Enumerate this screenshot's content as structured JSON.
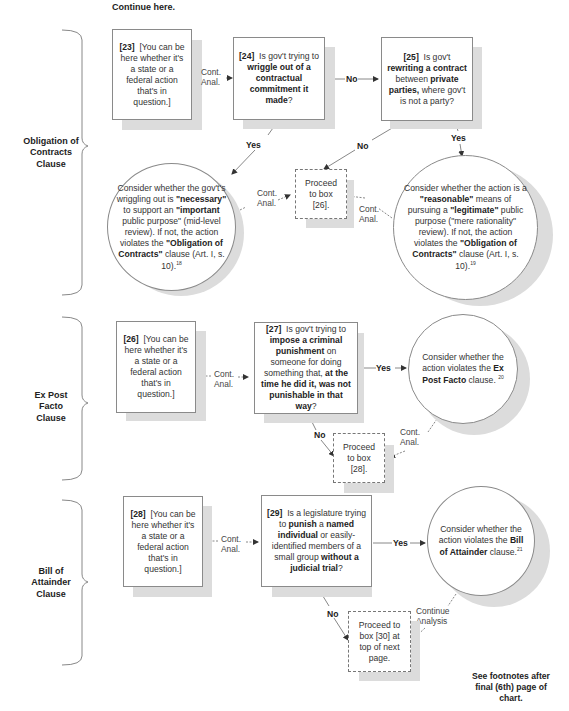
{
  "header": {
    "continue_text": "Continue here."
  },
  "sections": [
    {
      "label_lines": [
        "Obligation of",
        "Contracts",
        "Clause"
      ]
    },
    {
      "label_lines": [
        "Ex Post",
        "Facto",
        "Clause"
      ]
    },
    {
      "label_lines": [
        "Bill of",
        "Attainder",
        "Clause"
      ]
    }
  ],
  "edge_labels": {
    "cont": "Cont.",
    "anal": "Anal.",
    "yes": "Yes",
    "no": "No",
    "continue": "Continue",
    "analysis": "Analysis"
  },
  "boxes": {
    "b23": {
      "num": "[23]",
      "text": "[You can be here whether it's a state or a federal action that's in question.]"
    },
    "b24": {
      "num": "[24]",
      "pre": "Is gov't trying to ",
      "bold1": "wriggle out of a contractual commitment it made",
      "post": "?"
    },
    "b25": {
      "num": "[25]",
      "pre": "Is gov't ",
      "bold1": "rewriting a contract",
      "mid": " between ",
      "bold2": "private parties,",
      "post": " where gov't is not a party?"
    },
    "p26": {
      "text": "Proceed to box [26]."
    },
    "c_mid": {
      "t1": "Consider whether the gov't's wriggling out is ",
      "b1": "\"necessary\"",
      "t2": " to support an ",
      "b2": "\"important",
      "t3": " public purpose\" (mid-level review). If not, the action violates the ",
      "b3": "\"Obligation of Contracts\"",
      "t4": " clause (Art. I, s. 10).",
      "fn": "18"
    },
    "c_rat": {
      "t1": "Consider whether the action is a ",
      "b1": "\"reasonable\"",
      "t2": " means of pursuing a ",
      "b2": "\"legitimate\"",
      "t3": " public purpose (\"mere rationality\" review). If not, the action violates the ",
      "b3": "\"Obligation of Contracts\"",
      "t4": " clause (Art. I, s. 10).",
      "fn": "19"
    },
    "b26": {
      "num": "[26]",
      "text": "[You can be here whether it's a state or a federal action that's in question.]"
    },
    "b27": {
      "num": "[27]",
      "pre": "Is gov't trying to ",
      "bold1": "impose a criminal punishment",
      "mid": " on someone for doing something that, ",
      "bold2": "at the time he did it, was not punishable in that way",
      "post": "?"
    },
    "c_epf": {
      "t1": "Consider whether the action violates the ",
      "b1": "Ex Post Facto",
      "t2": " clause. ",
      "fn": "20"
    },
    "p28": {
      "text": "Proceed to box [28]."
    },
    "b28": {
      "num": "[28]",
      "text": "[You can be here whether it's a state or a federal action that's in question.]"
    },
    "b29": {
      "num": "[29]",
      "pre": "Is a legislature trying to ",
      "bold1": "punish",
      "mid": " a ",
      "bold2": "named individual",
      "mid2": " or easily-identified members of a small group ",
      "bold3": "without a judicial trial",
      "post": "?"
    },
    "c_boa": {
      "t1": "Consider whether the action violates the ",
      "b1": "Bill of Attainder",
      "t2": " clause.",
      "fn": "21"
    },
    "p30": {
      "text": "Proceed to box [30] at top of next page."
    }
  },
  "footer": {
    "note": "See footnotes after final (6th) page of chart."
  }
}
